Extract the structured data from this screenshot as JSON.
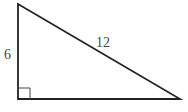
{
  "diagram": {
    "type": "right-triangle",
    "vertices": {
      "top": [
        18,
        4
      ],
      "bottom_left": [
        18,
        99
      ],
      "bottom_right": [
        180,
        99
      ]
    },
    "labels": {
      "vertical_leg": "6",
      "hypotenuse": "12"
    },
    "right_angle_marker": "bottom-left",
    "stroke_color": "#222222",
    "label_color": "#444444"
  }
}
